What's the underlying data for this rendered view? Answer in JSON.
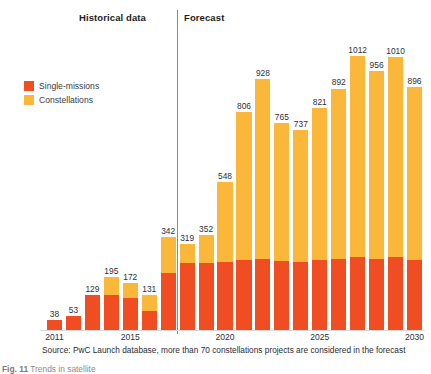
{
  "header": {
    "historical_label": "Historical data",
    "forecast_label": "Forecast"
  },
  "legend": {
    "items": [
      {
        "label": "Single-missions",
        "color": "#f04d23"
      },
      {
        "label": "Constellations",
        "color": "#fbb73a"
      }
    ]
  },
  "source": "Source: PwC Launch database, more than 70 constellations projects are considered in the forecast",
  "caption": {
    "label": "Fig. 11",
    "text": "Trends in satellite"
  },
  "colors": {
    "single_missions": "#f04d23",
    "constellations": "#fbb73a",
    "divider": "#8c8c8c",
    "text": "#2f2f3a"
  },
  "chart_data": {
    "type": "bar",
    "stacked": true,
    "title": "",
    "xlabel": "",
    "ylabel": "",
    "ylim": [
      0,
      1012
    ],
    "grid": false,
    "legend_position": "left-inside",
    "categories": [
      "2011",
      "2012",
      "2013",
      "2014",
      "2015",
      "2016",
      "2017",
      "2018",
      "2019",
      "2020",
      "2021",
      "2022",
      "2023",
      "2024",
      "2025",
      "2026",
      "2027",
      "2028",
      "2029",
      "2030"
    ],
    "tick_labels": [
      "2011",
      "2015",
      "2020",
      "2025",
      "2030"
    ],
    "tick_categories": [
      "2011",
      "2015",
      "2020",
      "2025",
      "2030"
    ],
    "totals": [
      38,
      53,
      129,
      195,
      172,
      131,
      342,
      319,
      352,
      548,
      806,
      928,
      765,
      737,
      821,
      892,
      1012,
      956,
      1010,
      896
    ],
    "data_labels": [
      "38",
      "53",
      "129",
      "195",
      "172",
      "131",
      "342",
      "319",
      "352",
      "548",
      "806",
      "928",
      "765",
      "737",
      "821",
      "892",
      "1012",
      "956",
      "1010",
      "896"
    ],
    "series": [
      {
        "name": "Single-missions",
        "color": "#f04d23",
        "values": [
          38,
          53,
          129,
          128,
          118,
          72,
          211,
          246,
          247,
          250,
          258,
          262,
          255,
          250,
          258,
          262,
          268,
          262,
          268,
          258
        ]
      },
      {
        "name": "Constellations",
        "color": "#fbb73a",
        "values": [
          0,
          0,
          0,
          67,
          54,
          59,
          131,
          73,
          105,
          298,
          548,
          666,
          510,
          487,
          563,
          630,
          744,
          694,
          742,
          638
        ]
      }
    ],
    "annotations": [
      {
        "text": "Historical data",
        "x_range": [
          "2011",
          "2018"
        ]
      },
      {
        "text": "Forecast",
        "x_range": [
          "2019",
          "2030"
        ]
      }
    ]
  }
}
